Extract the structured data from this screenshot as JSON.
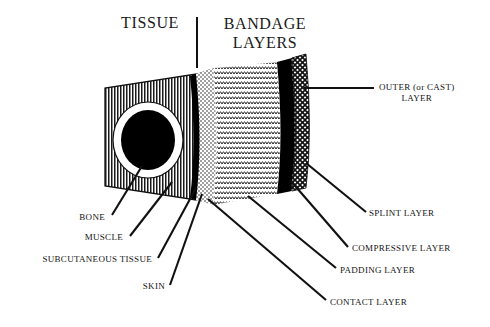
{
  "headings": {
    "tissue": "TISSUE",
    "bandage_line1": "BANDAGE",
    "bandage_line2": "LAYERS"
  },
  "labels": {
    "outer_line1": "OUTER (or CAST)",
    "outer_line2": "LAYER",
    "splint": "SPLINT LAYER",
    "compressive": "COMPRESSIVE LAYER",
    "padding": "PADDING LAYER",
    "contact": "CONTACT LAYER",
    "bone": "BONE",
    "muscle": "MUSCLE",
    "subcutaneous": "SUBCUTANEOUS TISSUE",
    "skin": "SKIN"
  },
  "colors": {
    "ink": "#111111",
    "background": "#ffffff",
    "fill_black": "#000000"
  },
  "diagram": {
    "type": "anatomical-cross-section",
    "layers": [
      {
        "name": "bone",
        "texture": "solid-black-ellipse",
        "side": "tissue"
      },
      {
        "name": "muscle",
        "texture": "white-ring",
        "side": "tissue"
      },
      {
        "name": "subcutaneous tissue",
        "texture": "vertical-hatch",
        "side": "tissue"
      },
      {
        "name": "skin",
        "texture": "solid-black-band",
        "side": "tissue"
      },
      {
        "name": "contact layer",
        "texture": "stipple",
        "side": "bandage"
      },
      {
        "name": "padding layer",
        "texture": "wavy-zigzag",
        "side": "bandage"
      },
      {
        "name": "compressive layer",
        "texture": "solid-black-band",
        "side": "bandage"
      },
      {
        "name": "splint layer",
        "texture": "diagonal-crosshatch",
        "side": "bandage"
      },
      {
        "name": "outer (or cast) layer",
        "texture": "diagonal-crosshatch",
        "side": "bandage"
      }
    ]
  }
}
